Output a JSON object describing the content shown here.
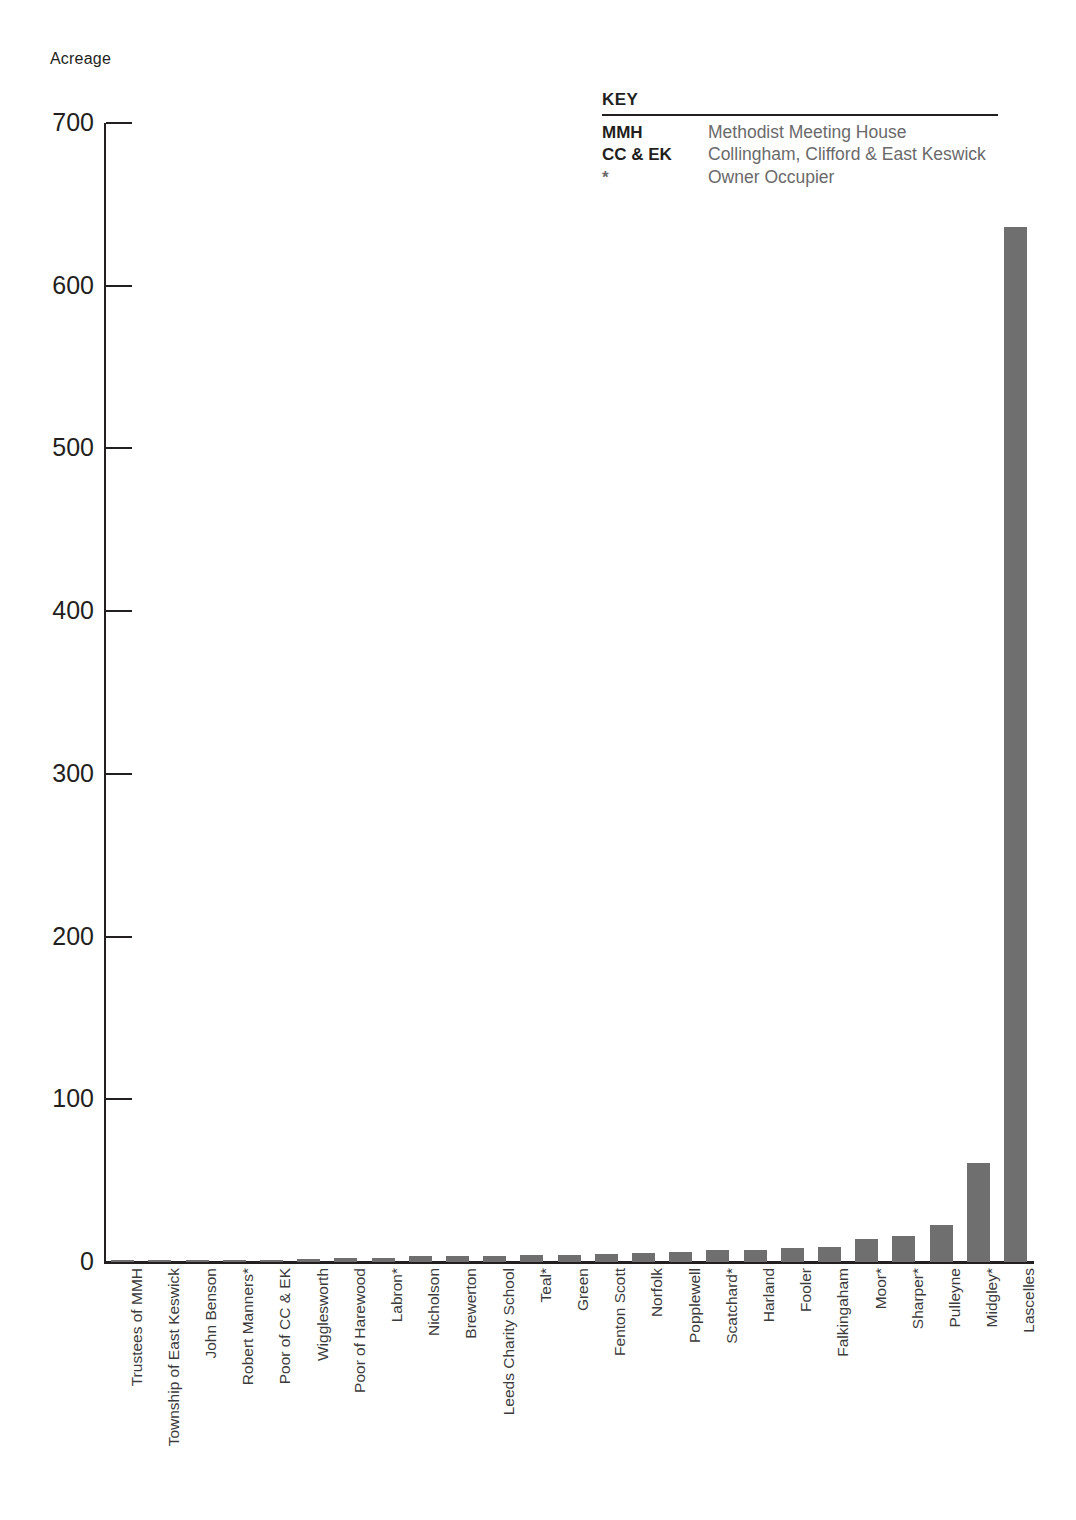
{
  "chart_data": {
    "type": "bar",
    "title": "",
    "subtitle": "",
    "xlabel": "",
    "ylabel": "Acreage",
    "ylim": [
      0,
      700
    ],
    "yticks": [
      0,
      100,
      200,
      300,
      400,
      500,
      600,
      700
    ],
    "grid": false,
    "legend_position": "top-right",
    "bar_color": "#706f6f",
    "categories": [
      "Trustees of MMH",
      "Township of East Keswick",
      "John Benson",
      "Robert Manners*",
      "Poor of CC & EK",
      "Wigglesworth",
      "Poor of Harewood",
      "Labron*",
      "Nicholson",
      "Brewerton",
      "Leeds Charity School",
      "Teal*",
      "Green",
      "Fenton Scott",
      "Norfolk",
      "Popplewell",
      "Scatchard*",
      "Harland",
      "Fooler",
      "Falkingaham",
      "Moor*",
      "Sharper*",
      "Pulleyne",
      "Midgley*",
      "Lascelles"
    ],
    "values": [
      0.4,
      0.5,
      0.6,
      1.2,
      1.3,
      2.0,
      2.2,
      2.6,
      3.4,
      3.6,
      3.8,
      4.4,
      4.6,
      5.2,
      5.6,
      6.2,
      7.2,
      7.6,
      8.6,
      9.2,
      14,
      16,
      23,
      61,
      636
    ]
  },
  "axis": {
    "y_title": "Acreage",
    "tick_labels": [
      "700",
      "600",
      "500",
      "400",
      "300",
      "200",
      "100",
      "0"
    ]
  },
  "key": {
    "title": "KEY",
    "rows": [
      {
        "abbr": "MMH",
        "desc": "Methodist Meeting House"
      },
      {
        "abbr": "CC & EK",
        "desc": "Collingham, Clifford & East Keswick"
      },
      {
        "abbr": "*",
        "desc": "Owner Occupier"
      }
    ]
  }
}
